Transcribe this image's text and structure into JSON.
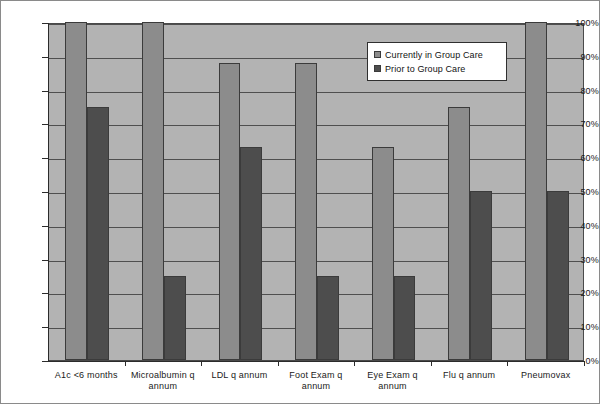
{
  "chart_data": {
    "type": "bar",
    "title": "",
    "subtitle": "",
    "xlabel": "",
    "ylabel": "",
    "ylim": [
      0,
      100
    ],
    "ytick_labels": [
      "0%",
      "10%",
      "20%",
      "30%",
      "40%",
      "50%",
      "60%",
      "70%",
      "80%",
      "90%",
      "100%"
    ],
    "ytick_values": [
      0,
      10,
      20,
      30,
      40,
      50,
      60,
      70,
      80,
      90,
      100
    ],
    "grid": true,
    "legend_position": "upper-right",
    "categories": [
      "A1c <6 months",
      "Microalbumin q annum",
      "LDL q annum",
      "Foot Exam q annum",
      "Eye Exam q annum",
      "Flu q annum",
      "Pneumovax"
    ],
    "series": [
      {
        "name": "Currently in Group Care",
        "color": "#8c8c8c",
        "values": [
          100,
          100,
          88,
          88,
          63,
          75,
          100
        ]
      },
      {
        "name": "Prior to Group Care",
        "color": "#4d4d4d",
        "values": [
          75,
          25,
          63,
          25,
          25,
          50,
          50
        ]
      }
    ]
  },
  "legend": {
    "items": [
      {
        "label": "Currently in Group Care",
        "swatch": "legend-swatch-light"
      },
      {
        "label": "Prior to Group Care",
        "swatch": "legend-swatch-dark"
      }
    ]
  },
  "colors": {
    "plot_background": "#b3b3b3",
    "gridline": "#4f4f4f",
    "axis": "#2b2b2b",
    "series_current": "#8c8c8c",
    "series_prior": "#4d4d4d",
    "figure_background": "#ffffff"
  }
}
